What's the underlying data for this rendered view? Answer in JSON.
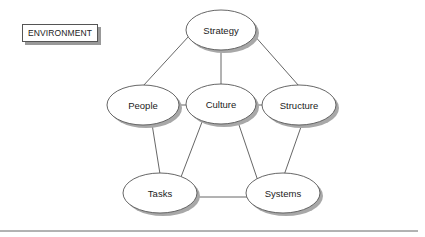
{
  "diagram": {
    "environment_label": "ENVIRONMENT",
    "nodes": [
      {
        "id": "strategy",
        "label": "Strategy",
        "cx": 221,
        "cy": 30
      },
      {
        "id": "people",
        "label": "People",
        "cx": 143,
        "cy": 105
      },
      {
        "id": "culture",
        "label": "Culture",
        "cx": 221,
        "cy": 104
      },
      {
        "id": "structure",
        "label": "Structure",
        "cx": 299,
        "cy": 105
      },
      {
        "id": "tasks",
        "label": "Tasks",
        "cx": 160,
        "cy": 193
      },
      {
        "id": "systems",
        "label": "Systems",
        "cx": 283,
        "cy": 193
      }
    ],
    "edges": [
      [
        "strategy",
        "people"
      ],
      [
        "strategy",
        "culture"
      ],
      [
        "strategy",
        "structure"
      ],
      [
        "people",
        "culture"
      ],
      [
        "culture",
        "structure"
      ],
      [
        "people",
        "tasks"
      ],
      [
        "culture",
        "tasks"
      ],
      [
        "culture",
        "systems"
      ],
      [
        "structure",
        "systems"
      ],
      [
        "tasks",
        "systems"
      ]
    ],
    "colors": {
      "stroke": "#444444",
      "fill": "#ffffff",
      "shadow": "#9a9a9a"
    }
  }
}
